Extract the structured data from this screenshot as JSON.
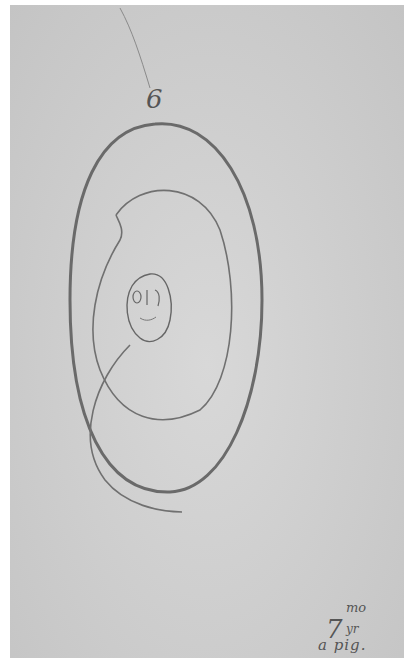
{
  "image": {
    "description": "Scanned pencil drawing on gray paper: a large oval enclosing a loose spiral with a small face at the center",
    "paper_color": "#cdcdcd",
    "stroke_color": "#6a6a6a"
  },
  "annotations": {
    "top_number": "6",
    "bottom_number": "7",
    "bottom_superscript": "mo",
    "bottom_subscript": "yr",
    "bottom_caption": "a pig."
  }
}
